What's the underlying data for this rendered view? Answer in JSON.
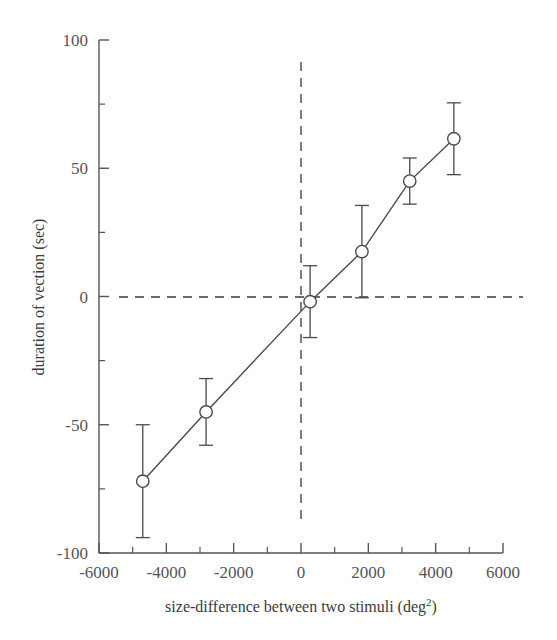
{
  "figure": {
    "background_color": "#ffffff",
    "line_color": "#4a4a4a",
    "marker_fill": "#ffffff",
    "text_color": "#555555"
  },
  "axes": {
    "x": {
      "title_main": "size-difference between two stimuli (deg",
      "title_sup": "2",
      "title_tail": ")",
      "tick_labels": [
        "-6000",
        "-4000",
        "-2000",
        "0",
        "2000",
        "4000",
        "6000"
      ],
      "tick_values": [
        -6000,
        -4000,
        -2000,
        0,
        2000,
        4000,
        6000
      ],
      "minor_step": 1000,
      "range": [
        -6000,
        6000
      ]
    },
    "y": {
      "title": "duration of vection (sec)",
      "tick_labels": [
        "100",
        "50",
        "0",
        "-50",
        "-100"
      ],
      "tick_values": [
        100,
        50,
        0,
        -50,
        -100
      ],
      "minor_step": 25,
      "range": [
        -100,
        100
      ]
    }
  },
  "reference_lines": {
    "horizontal_zero": 0,
    "vertical_zero": 0,
    "style": "dashed"
  },
  "chart_data": {
    "type": "line",
    "title": "",
    "xlabel": "size-difference between two stimuli (deg2)",
    "ylabel": "duration of vection (sec)",
    "xlim": [
      -6000,
      6000
    ],
    "ylim": [
      -100,
      100
    ],
    "grid": false,
    "legend": "none",
    "marker": "open-circle",
    "errorbars": "symmetric",
    "x": [
      -4700,
      -2820,
      270,
      1810,
      3230,
      4540
    ],
    "y": [
      -72,
      -45,
      -2,
      17.5,
      45,
      61.5
    ],
    "yerr": [
      22,
      13,
      14,
      18,
      9,
      14
    ],
    "series": [
      {
        "name": "duration of vection",
        "points": [
          {
            "x": -4700,
            "y": -72,
            "err": 22
          },
          {
            "x": -2820,
            "y": -45,
            "err": 13
          },
          {
            "x": 270,
            "y": -2,
            "err": 14
          },
          {
            "x": 1810,
            "y": 17.5,
            "err": 18
          },
          {
            "x": 3230,
            "y": 45,
            "err": 9
          },
          {
            "x": 4540,
            "y": 61.5,
            "err": 14
          }
        ]
      }
    ]
  }
}
